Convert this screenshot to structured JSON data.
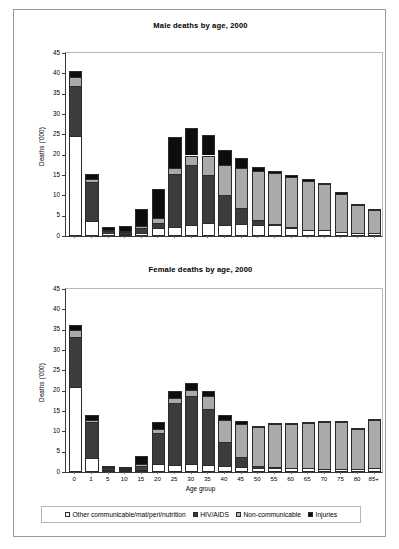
{
  "figure": {
    "series_names": [
      "Other communicable/mat/peri/nutrition",
      "HIV/AIDS",
      "Non-communicable",
      "Injuries"
    ],
    "colors": {
      "other": "#ffffff",
      "hiv": "#3c3c3c",
      "noncommunicable": "#aaaaaa",
      "injuries": "#0d0d0d",
      "axis": "#3a3a3a",
      "frame": "#9a9a9a"
    }
  },
  "legend": {
    "position": "bottom-center",
    "items": [
      {
        "label": "Other communicable/mat/peri/nutrition",
        "swatch": "sw-other",
        "icon": "legend-swatch-white"
      },
      {
        "label": "HIV/AIDS",
        "swatch": "sw-hiv",
        "icon": "legend-swatch-dark-gray"
      },
      {
        "label": "Non-communicable",
        "swatch": "sw-ncd",
        "icon": "legend-swatch-light-gray"
      },
      {
        "label": "Injuries",
        "swatch": "sw-inj",
        "icon": "legend-swatch-black"
      }
    ]
  },
  "chart_data": [
    {
      "type": "bar",
      "subtype": "stacked-vertical",
      "title": "Male deaths by age, 2000",
      "xlabel": "",
      "ylabel": "Deaths ('000)",
      "ylim": [
        0,
        45
      ],
      "yticks": [
        0,
        5,
        10,
        15,
        20,
        25,
        30,
        35,
        40,
        45
      ],
      "grid": false,
      "xtick_labels_shown": false,
      "categories": [
        "0",
        "1",
        "5",
        "10",
        "15",
        "20",
        "25",
        "30",
        "35",
        "40",
        "45",
        "50",
        "55",
        "60",
        "65",
        "70",
        "75",
        "80",
        "85+"
      ],
      "series": [
        {
          "name": "Other communicable/mat/peri/nutrition",
          "values": [
            24.5,
            3.7,
            0.7,
            0.6,
            0.7,
            2.0,
            2.3,
            2.8,
            3.2,
            2.8,
            3.0,
            2.8,
            2.6,
            2.0,
            1.6,
            1.5,
            1.0,
            0.8,
            0.8
          ]
        },
        {
          "name": "HIV/AIDS",
          "values": [
            12.5,
            9.6,
            0.5,
            0.4,
            1.2,
            1.3,
            12.9,
            14.7,
            11.7,
            7.4,
            3.8,
            1.2,
            0.4,
            0.1,
            0.0,
            0.0,
            0.0,
            0.0,
            0.0
          ]
        },
        {
          "name": "Non-communicable",
          "values": [
            2.2,
            0.6,
            0.3,
            0.3,
            0.6,
            1.2,
            1.5,
            2.3,
            4.9,
            7.3,
            10.0,
            12.0,
            12.4,
            12.4,
            11.9,
            11.2,
            9.4,
            6.9,
            5.5
          ]
        },
        {
          "name": "Injuries",
          "values": [
            1.4,
            1.3,
            0.8,
            1.1,
            4.1,
            7.0,
            7.6,
            6.7,
            5.0,
            3.7,
            2.4,
            1.0,
            0.6,
            0.5,
            0.5,
            0.3,
            0.4,
            0.2,
            0.1
          ]
        }
      ],
      "totals": [
        40.6,
        15.2,
        2.3,
        2.4,
        6.6,
        11.5,
        24.3,
        26.5,
        24.8,
        21.2,
        19.2,
        17.0,
        16.0,
        15.0,
        14.0,
        13.0,
        10.8,
        7.9,
        6.4
      ]
    },
    {
      "type": "bar",
      "subtype": "stacked-vertical",
      "title": "Female deaths by age, 2000",
      "xlabel": "Age group",
      "ylabel": "Deaths ('000)",
      "ylim": [
        0,
        45
      ],
      "yticks": [
        0,
        5,
        10,
        15,
        20,
        25,
        30,
        35,
        40,
        45
      ],
      "grid": false,
      "xtick_labels_shown": true,
      "categories": [
        "0",
        "1",
        "5",
        "10",
        "15",
        "20",
        "25",
        "30",
        "35",
        "40",
        "45",
        "50",
        "55",
        "60",
        "65",
        "70",
        "75",
        "80",
        "85+"
      ],
      "series": [
        {
          "name": "Other communicable/mat/peri/nutrition",
          "values": [
            20.8,
            3.4,
            0.5,
            0.4,
            0.6,
            2.0,
            1.8,
            2.0,
            1.7,
            1.5,
            1.3,
            1.1,
            1.0,
            0.9,
            0.9,
            0.8,
            0.8,
            0.7,
            1.0
          ]
        },
        {
          "name": "HIV/AIDS",
          "values": [
            12.4,
            8.8,
            0.4,
            0.3,
            0.9,
            7.5,
            15.2,
            16.8,
            13.9,
            5.8,
            2.3,
            0.5,
            0.2,
            0.1,
            0.0,
            0.0,
            0.0,
            0.0,
            0.0
          ]
        },
        {
          "name": "Non-communicable",
          "values": [
            1.7,
            0.6,
            0.3,
            0.2,
            0.5,
            1.0,
            1.1,
            1.3,
            3.1,
            5.4,
            8.3,
            9.4,
            10.5,
            10.8,
            11.1,
            11.5,
            11.4,
            10.0,
            11.8
          ]
        },
        {
          "name": "Injuries",
          "values": [
            1.3,
            1.2,
            0.4,
            0.2,
            2.0,
            1.7,
            1.9,
            1.9,
            1.3,
            1.3,
            0.6,
            0.4,
            0.3,
            0.2,
            0.2,
            0.2,
            0.2,
            0.1,
            0.1
          ]
        }
      ],
      "totals": [
        36.2,
        14.0,
        1.6,
        1.1,
        4.0,
        12.2,
        20.0,
        22.0,
        20.0,
        14.0,
        12.5,
        11.4,
        12.0,
        12.0,
        12.2,
        12.5,
        12.4,
        10.8,
        12.9
      ]
    }
  ]
}
